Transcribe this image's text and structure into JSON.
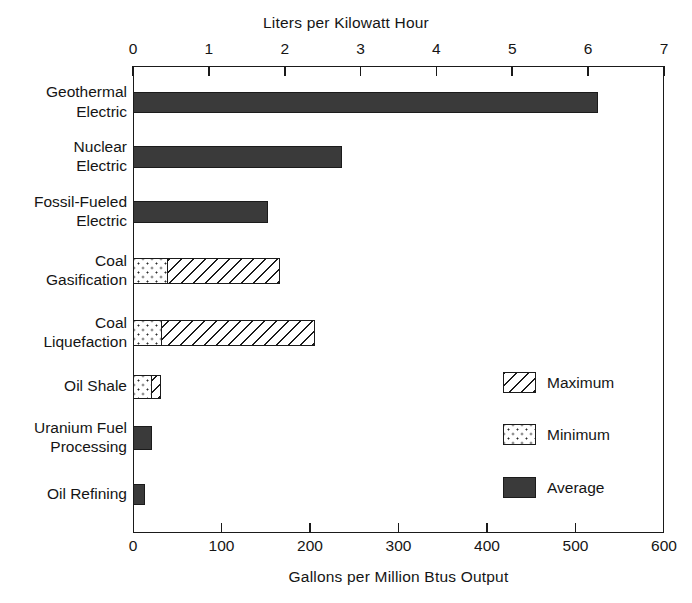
{
  "chart_data": {
    "type": "bar",
    "orientation": "horizontal",
    "title": "",
    "xlabel": "Gallons per Million Btus Output",
    "xlabel_top": "Liters per Kilowatt Hour",
    "ylabel": "",
    "grid": false,
    "legend_position": "inside-right",
    "xlim": [
      0,
      600
    ],
    "xticks": [
      0,
      100,
      200,
      300,
      400,
      500,
      600
    ],
    "xticklabels": [
      "0",
      "100",
      "200",
      "300",
      "400",
      "500",
      "600"
    ],
    "xlim_top": [
      0,
      7
    ],
    "xticks_top": [
      0,
      1,
      2,
      3,
      4,
      5,
      6,
      7
    ],
    "xticklabels_top": [
      "0",
      "1",
      "2",
      "3",
      "4",
      "5",
      "6",
      "7"
    ],
    "categories": [
      "Geothermal Electric",
      "Nuclear Electric",
      "Fossil-Fueled Electric",
      "Coal Gasification",
      "Coal Liquefaction",
      "Oil Shale",
      "Uranium Fuel Processing",
      "Oil Refining"
    ],
    "category_lines": [
      [
        "Geothermal",
        "Electric"
      ],
      [
        "Nuclear",
        "Electric"
      ],
      [
        "Fossil-Fueled",
        "Electric"
      ],
      [
        "Coal",
        "Gasification"
      ],
      [
        "Coal",
        "Liquefaction"
      ],
      [
        "Oil Shale"
      ],
      [
        "Uranium Fuel",
        "Processing"
      ],
      [
        "Oil Refining"
      ]
    ],
    "series": [
      {
        "name": "Minimum",
        "pattern": "dotted",
        "values": [
          null,
          null,
          null,
          40,
          33,
          21,
          null,
          null
        ]
      },
      {
        "name": "Maximum",
        "pattern": "hatched",
        "values": [
          null,
          null,
          null,
          166,
          206,
          32,
          null,
          null
        ]
      },
      {
        "name": "Average",
        "pattern": "solid-dark",
        "values": [
          525,
          236,
          152,
          null,
          null,
          null,
          21,
          13
        ]
      }
    ],
    "bars": [
      {
        "category": "Geothermal Electric",
        "average": 525,
        "minimum": null,
        "maximum": null
      },
      {
        "category": "Nuclear Electric",
        "average": 236,
        "minimum": null,
        "maximum": null
      },
      {
        "category": "Fossil-Fueled Electric",
        "average": 152,
        "minimum": null,
        "maximum": null
      },
      {
        "category": "Coal Gasification",
        "average": null,
        "minimum": 40,
        "maximum": 166
      },
      {
        "category": "Coal Liquefaction",
        "average": null,
        "minimum": 33,
        "maximum": 206
      },
      {
        "category": "Oil Shale",
        "average": null,
        "minimum": 21,
        "maximum": 32
      },
      {
        "category": "Uranium Fuel Processing",
        "average": 21,
        "minimum": null,
        "maximum": null
      },
      {
        "category": "Oil Refining",
        "average": 13,
        "minimum": null,
        "maximum": null
      }
    ],
    "legend": [
      {
        "label": "Maximum",
        "pattern": "hatched"
      },
      {
        "label": "Minimum",
        "pattern": "dotted"
      },
      {
        "label": "Average",
        "pattern": "solid-dark"
      }
    ],
    "colors": {
      "average_fill": "#3a3a3a",
      "outline": "#1b1b1b",
      "background": "#ffffff",
      "text": "#151515"
    }
  }
}
